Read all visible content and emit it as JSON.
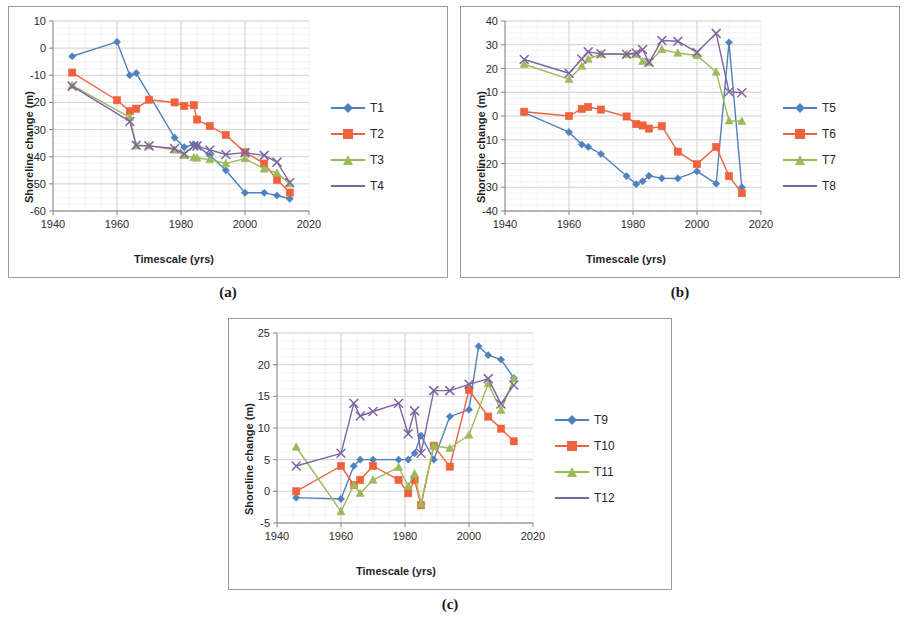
{
  "figure": {
    "panels": [
      {
        "id": "a",
        "caption": "(a)",
        "xlabel": "Timescale (yrs)",
        "ylabel": "Shoreline change (m)"
      },
      {
        "id": "b",
        "caption": "(b)",
        "xlabel": "Timescale (yrs)",
        "ylabel": "Shoreline change (m)"
      },
      {
        "id": "c",
        "caption": "(c)",
        "xlabel": "Timescale (yrs)",
        "ylabel": "Shoreline change (m)"
      }
    ]
  },
  "colors": {
    "T1": "#4f81bd",
    "T2": "#f0623d",
    "T3": "#9bbb59",
    "T4": "#8064a2",
    "series_blue": "#4f81bd",
    "series_orange": "#f0623d",
    "series_green": "#9bbb59",
    "series_purple": "#8064a2",
    "grid": "#d0d0d0",
    "axis": "#808080",
    "frame": "#9a9a9a"
  },
  "chart_data": [
    {
      "id": "a",
      "type": "line",
      "title": "",
      "xlabel": "Timescale (yrs)",
      "ylabel": "Shoreline change (m)",
      "xlim": [
        1940,
        2020
      ],
      "ylim": [
        -60,
        10
      ],
      "xticks": [
        1940,
        1960,
        1980,
        2000,
        2020
      ],
      "yticks": [
        10,
        0,
        -10,
        -20,
        -30,
        -40,
        -50,
        -60
      ],
      "grid": true,
      "legend_position": "right",
      "series": [
        {
          "name": "T1",
          "color": "#4f81bd",
          "marker": "diamond",
          "x": [
            1946,
            1960,
            1964,
            1966,
            1978,
            1981,
            1984,
            1985,
            1989,
            1994,
            2000,
            2006,
            2010,
            2014
          ],
          "y": [
            -3.0,
            2.3,
            -10.0,
            -9.2,
            -33.0,
            -36.5,
            -35.5,
            -36.0,
            -39.5,
            -45.0,
            -53.3,
            -53.3,
            -54.3,
            -55.5
          ]
        },
        {
          "name": "T2",
          "color": "#f0623d",
          "marker": "square",
          "x": [
            1946,
            1960,
            1964,
            1966,
            1970,
            1978,
            1981,
            1984,
            1985,
            1989,
            1994,
            2000,
            2006,
            2010,
            2014
          ],
          "y": [
            -9.0,
            -19.2,
            -23.2,
            -22.3,
            -19.0,
            -20.0,
            -21.3,
            -21.0,
            -26.3,
            -28.7,
            -32.0,
            -38.4,
            -42.5,
            -48.5,
            -53.2
          ]
        },
        {
          "name": "T3",
          "color": "#9bbb59",
          "marker": "triangle",
          "x": [
            1946,
            1964,
            1966,
            1970,
            1978,
            1981,
            1984,
            1985,
            1989,
            1994,
            2000,
            2006,
            2010,
            2014
          ],
          "y": [
            -13.7,
            -25.5,
            -36.0,
            -36.0,
            -37.5,
            -39.5,
            -40.3,
            -40.5,
            -41.0,
            -42.5,
            -40.7,
            -44.5,
            -46.0,
            -50.0
          ]
        },
        {
          "name": "T4",
          "color": "#8064a2",
          "marker": "x",
          "x": [
            1946,
            1964,
            1966,
            1970,
            1978,
            1981,
            1984,
            1985,
            1989,
            1994,
            2000,
            2006,
            2010,
            2014
          ],
          "y": [
            -14.0,
            -27.0,
            -35.8,
            -36.0,
            -37.0,
            -39.0,
            -36.0,
            -36.0,
            -37.5,
            -39.2,
            -38.5,
            -39.5,
            -42.0,
            -49.5
          ]
        }
      ]
    },
    {
      "id": "b",
      "type": "line",
      "title": "",
      "xlabel": "Timescale (yrs)",
      "ylabel": "Shoreline change (m)",
      "xlim": [
        1940,
        2020
      ],
      "ylim": [
        -40,
        40
      ],
      "xticks": [
        1940,
        1960,
        1980,
        2000,
        2020
      ],
      "yticks": [
        40,
        30,
        20,
        10,
        0,
        -10,
        -20,
        -30,
        -40
      ],
      "grid": true,
      "legend_position": "right",
      "series": [
        {
          "name": "T5",
          "color": "#4f81bd",
          "marker": "diamond",
          "x": [
            1946,
            1960,
            1964,
            1966,
            1970,
            1978,
            1981,
            1983,
            1985,
            1989,
            1994,
            2000,
            2006,
            2010,
            2014
          ],
          "y": [
            1.4,
            -6.8,
            -12.0,
            -13.0,
            -16.0,
            -25.3,
            -28.7,
            -27.5,
            -25.2,
            -26.2,
            -26.3,
            -23.3,
            -28.5,
            31.0,
            -30.0
          ]
        },
        {
          "name": "T6",
          "color": "#f0623d",
          "marker": "square",
          "x": [
            1946,
            1960,
            1964,
            1966,
            1970,
            1978,
            1981,
            1983,
            1985,
            1989,
            1994,
            2000,
            2006,
            2010,
            2014
          ],
          "y": [
            1.8,
            0.0,
            3.0,
            3.8,
            2.7,
            -0.2,
            -3.4,
            -4.0,
            -5.3,
            -4.3,
            -15.0,
            -20.3,
            -13.0,
            -25.3,
            -32.5
          ]
        },
        {
          "name": "T7",
          "color": "#9bbb59",
          "marker": "triangle",
          "x": [
            1946,
            1960,
            1964,
            1966,
            1970,
            1978,
            1981,
            1983,
            1985,
            1989,
            1994,
            2000,
            2006,
            2010,
            2014
          ],
          "y": [
            21.8,
            15.5,
            21.0,
            24.0,
            26.0,
            26.0,
            26.0,
            23.0,
            22.5,
            28.0,
            26.5,
            25.5,
            18.5,
            -2.0,
            -2.2
          ]
        },
        {
          "name": "T8",
          "color": "#8064a2",
          "marker": "x",
          "x": [
            1946,
            1960,
            1964,
            1966,
            1970,
            1978,
            1981,
            1983,
            1985,
            1989,
            1994,
            2000,
            2006,
            2010,
            2014
          ],
          "y": [
            23.8,
            18.0,
            24.0,
            27.0,
            26.2,
            26.0,
            26.5,
            28.0,
            22.5,
            31.8,
            31.5,
            26.8,
            34.8,
            10.2,
            9.8
          ]
        }
      ]
    },
    {
      "id": "c",
      "type": "line",
      "title": "",
      "xlabel": "Timescale (yrs)",
      "ylabel": "Shoreline change (m)",
      "xlim": [
        1940,
        2020
      ],
      "ylim": [
        -5,
        25
      ],
      "xticks": [
        1940,
        1960,
        1980,
        2000,
        2020
      ],
      "yticks": [
        25,
        20,
        15,
        10,
        5,
        0,
        -5
      ],
      "grid": true,
      "legend_position": "right",
      "series": [
        {
          "name": "T9",
          "color": "#4f81bd",
          "marker": "diamond",
          "x": [
            1946,
            1960,
            1964,
            1966,
            1970,
            1978,
            1981,
            1983,
            1985,
            1989,
            1994,
            2000,
            2003,
            2006,
            2010,
            2014
          ],
          "y": [
            -1.0,
            -1.2,
            4.0,
            5.0,
            5.0,
            5.0,
            5.0,
            6.0,
            8.8,
            5.0,
            11.8,
            12.9,
            22.9,
            21.5,
            20.8,
            17.9
          ]
        },
        {
          "name": "T10",
          "color": "#f0623d",
          "marker": "square",
          "x": [
            1946,
            1960,
            1964,
            1966,
            1970,
            1978,
            1981,
            1983,
            1985,
            1989,
            1994,
            2000,
            2006,
            2010,
            2014
          ],
          "y": [
            0.0,
            4.0,
            1.0,
            1.8,
            4.0,
            1.8,
            -0.3,
            1.8,
            -2.2,
            7.2,
            3.9,
            16.0,
            11.8,
            9.9,
            7.9
          ]
        },
        {
          "name": "T11",
          "color": "#9bbb59",
          "marker": "triangle",
          "x": [
            1946,
            1960,
            1964,
            1966,
            1970,
            1978,
            1981,
            1983,
            1985,
            1989,
            1994,
            2000,
            2006,
            2010,
            2014
          ],
          "y": [
            7.0,
            -3.2,
            1.0,
            -0.3,
            1.8,
            3.8,
            0.8,
            2.8,
            -2.0,
            7.2,
            6.8,
            8.9,
            17.0,
            12.8,
            17.8
          ]
        },
        {
          "name": "T12",
          "color": "#8064a2",
          "marker": "x",
          "x": [
            1946,
            1960,
            1964,
            1966,
            1970,
            1978,
            1981,
            1983,
            1985,
            1989,
            1994,
            2000,
            2006,
            2010,
            2014
          ],
          "y": [
            4.0,
            6.0,
            13.9,
            11.9,
            12.6,
            13.9,
            9.1,
            12.7,
            6.0,
            15.9,
            15.9,
            16.9,
            17.8,
            13.8,
            16.8
          ]
        }
      ]
    }
  ],
  "legends": {
    "a": [
      {
        "label": "T1",
        "color": "#4f81bd",
        "marker": "diamond"
      },
      {
        "label": "T2",
        "color": "#f0623d",
        "marker": "square"
      },
      {
        "label": "T3",
        "color": "#9bbb59",
        "marker": "triangle"
      },
      {
        "label": "T4",
        "color": "#8064a2",
        "marker": "line"
      }
    ],
    "b": [
      {
        "label": "T5",
        "color": "#4f81bd",
        "marker": "diamond"
      },
      {
        "label": "T6",
        "color": "#f0623d",
        "marker": "square"
      },
      {
        "label": "T7",
        "color": "#9bbb59",
        "marker": "triangle"
      },
      {
        "label": "T8",
        "color": "#8064a2",
        "marker": "line"
      }
    ],
    "c": [
      {
        "label": "T9",
        "color": "#4f81bd",
        "marker": "diamond"
      },
      {
        "label": "T10",
        "color": "#f0623d",
        "marker": "square"
      },
      {
        "label": "T11",
        "color": "#9bbb59",
        "marker": "triangle"
      },
      {
        "label": "T12",
        "color": "#8064a2",
        "marker": "line"
      }
    ]
  }
}
